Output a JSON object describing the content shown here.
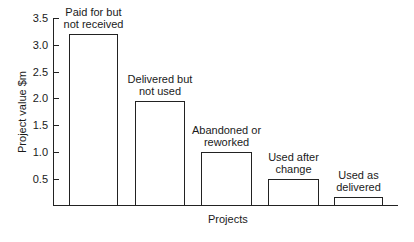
{
  "chart_data": {
    "type": "bar",
    "title": "",
    "xlabel": "Projects",
    "ylabel": "Project value $m",
    "ylim": [
      0,
      3.5
    ],
    "yticks": [
      "0.5",
      "1.0",
      "1.5",
      "2.0",
      "2.5",
      "3.0",
      "3.5"
    ],
    "grid": false,
    "categories": [
      "Paid for but not received",
      "Delivered but not used",
      "Abandoned or reworked",
      "Used after change",
      "Used as delivered"
    ],
    "category_lines": [
      [
        "Paid for but",
        "not received"
      ],
      [
        "Delivered but",
        "not used"
      ],
      [
        "Abandoned or",
        "reworked"
      ],
      [
        "Used after",
        "change"
      ],
      [
        "Used as",
        "delivered"
      ]
    ],
    "values": [
      3.2,
      1.95,
      1.0,
      0.5,
      0.15
    ]
  }
}
